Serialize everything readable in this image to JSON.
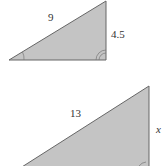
{
  "figure": {
    "type": "similar right triangles",
    "colors": {
      "fill": "#c4c4c4",
      "stroke": "#666666",
      "text": "#333333"
    }
  },
  "triangles": [
    {
      "name": "small-triangle",
      "hypotenuse_label": "9",
      "side_label": "4.5",
      "vertices": [
        [
          9,
          60
        ],
        [
          106,
          1
        ],
        [
          106,
          60
        ]
      ]
    },
    {
      "name": "large-triangle",
      "hypotenuse_label": "13",
      "side_label": "x",
      "vertices": [
        [
          14,
          172
        ],
        [
          149,
          86
        ],
        [
          149,
          172
        ]
      ]
    }
  ]
}
